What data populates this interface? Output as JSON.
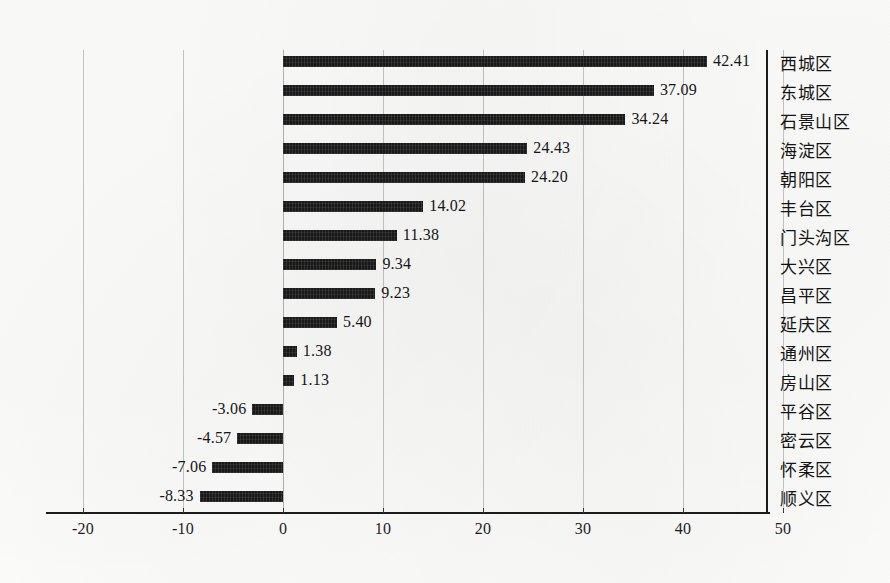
{
  "chart_data": {
    "type": "bar",
    "orientation": "horizontal",
    "title": "",
    "subtitle": "",
    "xlabel": "",
    "ylabel": "",
    "xlim": [
      -20,
      50
    ],
    "ylim": null,
    "grid": true,
    "gridlines_axis": "x",
    "legend": false,
    "legend_position": "none",
    "bar_color": "#191919",
    "background_color": "#fdfdfc",
    "axis_color": "#1b1b1b",
    "gridline_color": "#c6c6c6",
    "data_labels": true,
    "data_label_format": "0.00",
    "sorted": "descending",
    "xticks": [
      -20,
      -10,
      0,
      10,
      20,
      30,
      40,
      50
    ],
    "xtick_labels": [
      "-20",
      "-10",
      "0",
      "10",
      "20",
      "30",
      "40",
      "50"
    ],
    "categories": [
      "西城区",
      "东城区",
      "石景山区",
      "海淀区",
      "朝阳区",
      "丰台区",
      "门头沟区",
      "大兴区",
      "昌平区",
      "延庆区",
      "通州区",
      "房山区",
      "平谷区",
      "密云区",
      "怀柔区",
      "顺义区"
    ],
    "values": [
      42.41,
      37.09,
      34.24,
      24.43,
      24.2,
      14.02,
      11.38,
      9.34,
      9.23,
      5.4,
      1.38,
      1.13,
      -3.06,
      -4.57,
      -7.06,
      -8.33
    ],
    "value_labels": [
      "42.41",
      "37.09",
      "34.24",
      "24.43",
      "24.20",
      "14.02",
      "11.38",
      "9.34",
      "9.23",
      "5.40",
      "1.38",
      "1.13",
      "-3.06",
      "-4.57",
      "-7.06",
      "-8.33"
    ]
  }
}
